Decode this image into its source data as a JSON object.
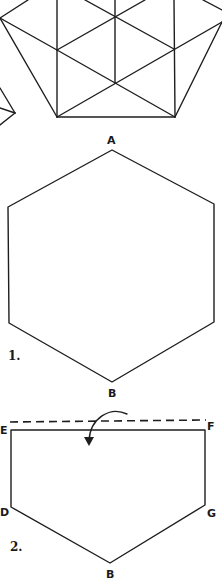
{
  "figure_top": {
    "description": "Partial view of folded-hexagon pattern with triangular crease lines",
    "color": "#1e1e1e"
  },
  "figure_1": {
    "number_label": "1.",
    "vertex_top_label": "A",
    "vertex_bottom_label": "B"
  },
  "figure_2": {
    "number_label": "2.",
    "labels": {
      "top_left": "E",
      "top_right": "F",
      "mid_left": "D",
      "mid_right": "G",
      "bottom": "B"
    },
    "fold_line": "dashed",
    "fold_arrow": "curved-arrow-down"
  }
}
